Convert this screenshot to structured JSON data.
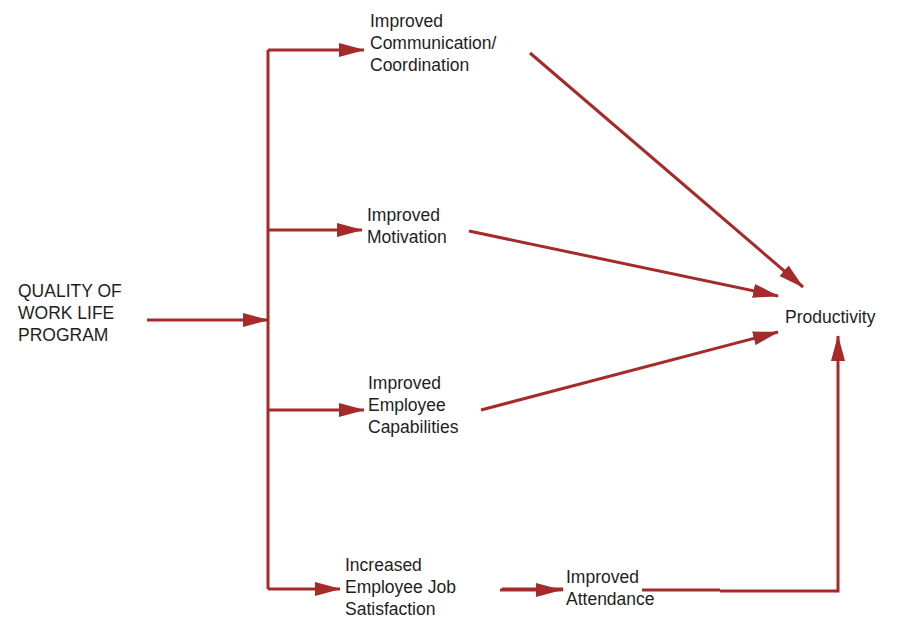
{
  "diagram": {
    "colors": {
      "arrow": "#a52a2a",
      "text": "#1e1e1e",
      "background": "#ffffff"
    },
    "source": {
      "lines": [
        "QUALITY OF",
        "WORK LIFE",
        "PROGRAM"
      ]
    },
    "intermediates": [
      {
        "id": "communication",
        "lines": [
          "Improved",
          "Communication/",
          "Coordination"
        ]
      },
      {
        "id": "motivation",
        "lines": [
          "Improved",
          "Motivation"
        ]
      },
      {
        "id": "capabilities",
        "lines": [
          "Improved",
          "Employee",
          "Capabilities"
        ]
      },
      {
        "id": "satisfaction",
        "lines": [
          "Increased",
          "Employee Job",
          "Satisfaction"
        ]
      }
    ],
    "attendance": {
      "lines": [
        "Improved",
        "Attendance"
      ]
    },
    "outcome": {
      "label": "Productivity"
    },
    "edges": [
      [
        "QUALITY OF WORK LIFE PROGRAM",
        "Improved Communication/Coordination"
      ],
      [
        "QUALITY OF WORK LIFE PROGRAM",
        "Improved Motivation"
      ],
      [
        "QUALITY OF WORK LIFE PROGRAM",
        "Improved Employee Capabilities"
      ],
      [
        "QUALITY OF WORK LIFE PROGRAM",
        "Increased Employee Job Satisfaction"
      ],
      [
        "Improved Communication/Coordination",
        "Productivity"
      ],
      [
        "Improved Motivation",
        "Productivity"
      ],
      [
        "Improved Employee Capabilities",
        "Productivity"
      ],
      [
        "Increased Employee Job Satisfaction",
        "Improved Attendance"
      ],
      [
        "Improved Attendance",
        "Productivity"
      ]
    ]
  }
}
